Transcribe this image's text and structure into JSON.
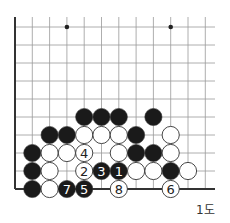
{
  "diagram": {
    "caption": "1도",
    "grid": {
      "origin_x": 15,
      "origin_y": 27,
      "spacing_x": 17.3,
      "spacing_y": 18,
      "cols": 12,
      "rows": 10,
      "top_y": 17,
      "right_x": 215,
      "left_edge": true,
      "bottom_edge": true
    },
    "hoshi": [
      {
        "col": 3,
        "row": 0
      },
      {
        "col": 9,
        "row": 0
      }
    ],
    "stones": [
      {
        "col": 4,
        "row": 5,
        "color": "black"
      },
      {
        "col": 5,
        "row": 5,
        "color": "black"
      },
      {
        "col": 6,
        "row": 5,
        "color": "black"
      },
      {
        "col": 8,
        "row": 5,
        "color": "black"
      },
      {
        "col": 2,
        "row": 6,
        "color": "black"
      },
      {
        "col": 3,
        "row": 6,
        "color": "black"
      },
      {
        "col": 4,
        "row": 6,
        "color": "white"
      },
      {
        "col": 5,
        "row": 6,
        "color": "white"
      },
      {
        "col": 6,
        "row": 6,
        "color": "white"
      },
      {
        "col": 7,
        "row": 6,
        "color": "black"
      },
      {
        "col": 9,
        "row": 6,
        "color": "white"
      },
      {
        "col": 1,
        "row": 7,
        "color": "black"
      },
      {
        "col": 2,
        "row": 7,
        "color": "white"
      },
      {
        "col": 3,
        "row": 7,
        "color": "white"
      },
      {
        "col": 4,
        "row": 7,
        "color": "white",
        "label": "4"
      },
      {
        "col": 6,
        "row": 7,
        "color": "white"
      },
      {
        "col": 7,
        "row": 7,
        "color": "black"
      },
      {
        "col": 8,
        "row": 7,
        "color": "black"
      },
      {
        "col": 9,
        "row": 7,
        "color": "white"
      },
      {
        "col": 1,
        "row": 8,
        "color": "black"
      },
      {
        "col": 2,
        "row": 8,
        "color": "white"
      },
      {
        "col": 4,
        "row": 8,
        "color": "white",
        "label": "2"
      },
      {
        "col": 5,
        "row": 8,
        "color": "black",
        "label": "3"
      },
      {
        "col": 6,
        "row": 8,
        "color": "black",
        "label": "1"
      },
      {
        "col": 7,
        "row": 8,
        "color": "white"
      },
      {
        "col": 8,
        "row": 8,
        "color": "white"
      },
      {
        "col": 9,
        "row": 8,
        "color": "black"
      },
      {
        "col": 10,
        "row": 8,
        "color": "white"
      },
      {
        "col": 1,
        "row": 9,
        "color": "black"
      },
      {
        "col": 2,
        "row": 9,
        "color": "white"
      },
      {
        "col": 3,
        "row": 9,
        "color": "black",
        "label": "7"
      },
      {
        "col": 4,
        "row": 9,
        "color": "black",
        "label": "5"
      },
      {
        "col": 6,
        "row": 9,
        "color": "white",
        "label": "8"
      },
      {
        "col": 9,
        "row": 9,
        "color": "white",
        "label": "6"
      }
    ],
    "colors": {
      "grid_line": "#999999",
      "edge_line": "#333333",
      "black_stone": "#1a1a1a",
      "white_stone": "#ffffff",
      "stone_outline": "#333333"
    }
  }
}
